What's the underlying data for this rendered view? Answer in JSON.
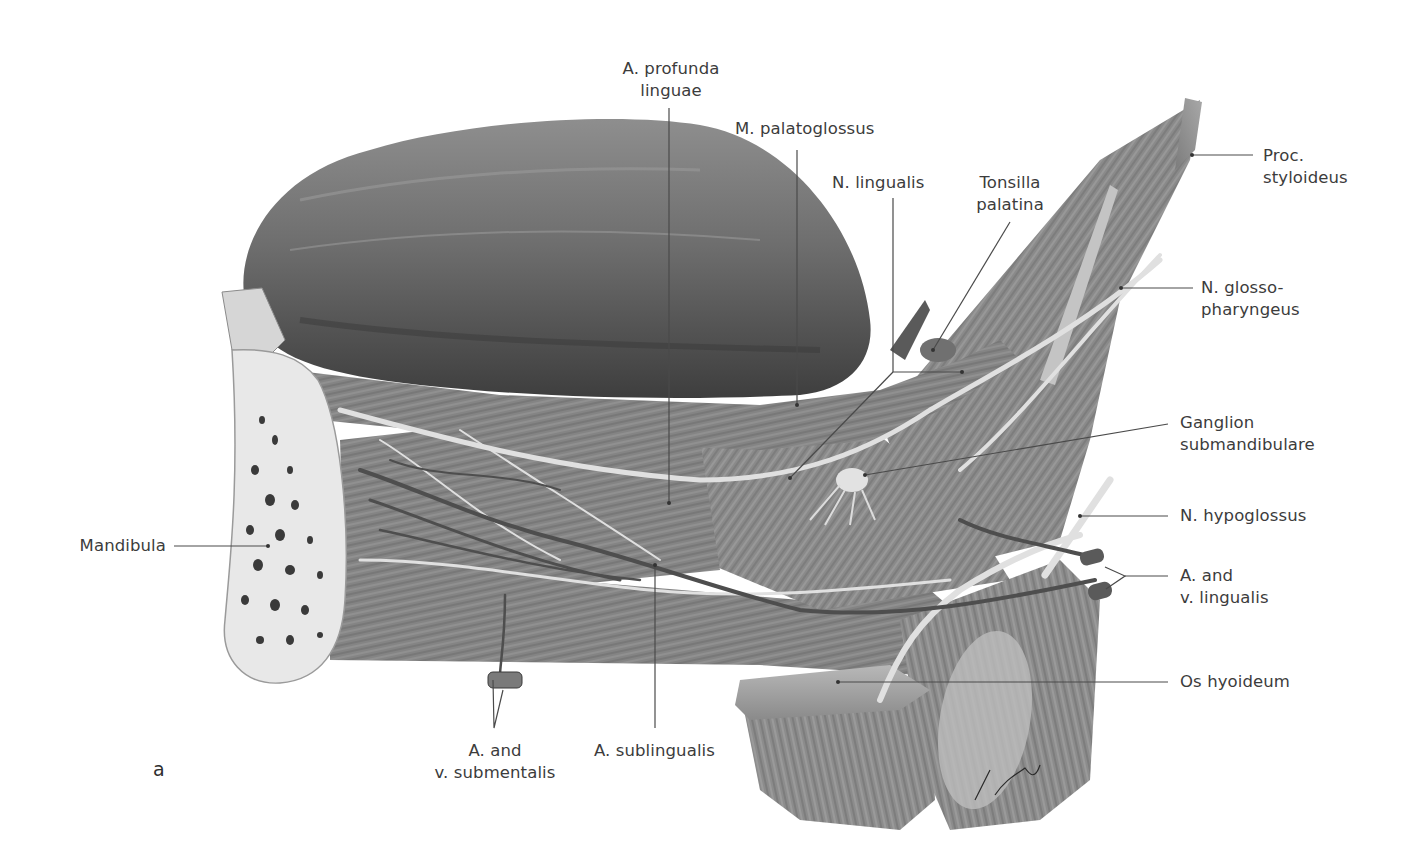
{
  "figure": {
    "panel_letter": "a",
    "palette": {
      "background": "#ffffff",
      "tongue_dark": "#5c5c5c",
      "tongue_mid": "#7a7a7a",
      "muscle": "#8a8a8a",
      "muscle_light": "#b4b4b4",
      "bone": "#e6e6e6",
      "nerve": "#d9d9d9",
      "vessel": "#555555",
      "leader_line": "#4a4a4a",
      "text": "#3c3c3c"
    },
    "labels": {
      "a_profunda_linguae": "A. profunda\nlinguae",
      "m_palatoglossus": "M. palatoglossus",
      "n_lingualis": "N. lingualis",
      "tonsilla_palatina": "Tonsilla\npalatina",
      "proc_styloideus": "Proc.\nstyloideus",
      "n_glossopharyngeus": "N. glosso-\npharyngeus",
      "ganglion_submandibulare": "Ganglion\nsubmandibulare",
      "n_hypoglossus": "N. hypoglossus",
      "a_v_lingualis": "A. and\nv. lingualis",
      "os_hyoideum": "Os hyoideum",
      "mandibula": "Mandibula",
      "a_v_submentalis": "A. and\nv. submentalis",
      "a_sublingualis": "A. sublingualis"
    }
  }
}
